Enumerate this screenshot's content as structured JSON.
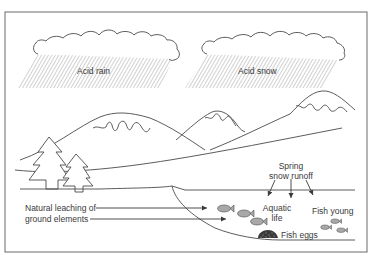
{
  "diagram": {
    "colors": {
      "line": "#4a4a4a",
      "hatch": "#9a9a9a",
      "fish_fill": "#a8a8a8",
      "eggs_fill": "#3a3a3a",
      "text": "#3a3a3a",
      "border": "#6a6a6a"
    },
    "clouds": [
      {
        "id": "cloud-left",
        "label": "Acid rain"
      },
      {
        "id": "cloud-right",
        "label": "Acid snow"
      }
    ],
    "labels": {
      "acid_rain": "Acid rain",
      "acid_snow": "Acid snow",
      "spring_line1": "Spring",
      "spring_line2": "snow runoff",
      "leaching_line1": "Natural leaching of",
      "leaching_line2": "ground elements",
      "aquatic_line1": "Aquatic",
      "aquatic_line2": "life",
      "fish_young": "Fish young",
      "fish_eggs": "Fish eggs"
    },
    "elements": {
      "mountains": 3,
      "trees": 2,
      "adult_fish": 3,
      "young_fish": 3,
      "runoff_arrows": 3,
      "leaching_arrows": 2
    }
  }
}
